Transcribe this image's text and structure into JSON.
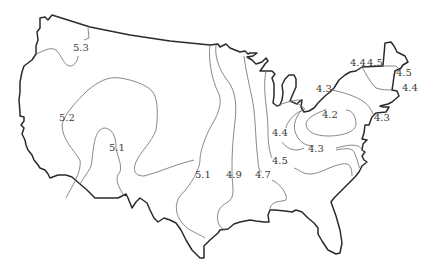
{
  "map": {
    "type": "isoline-map",
    "region": "Contiguous United States",
    "labels": [
      {
        "id": "l1",
        "text": "5.3",
        "x": 80,
        "y": 51
      },
      {
        "id": "l2",
        "text": "5.2",
        "x": 66,
        "y": 121
      },
      {
        "id": "l3",
        "text": "5.1",
        "x": 116,
        "y": 151
      },
      {
        "id": "l4",
        "text": "5.1",
        "x": 203,
        "y": 178
      },
      {
        "id": "l5",
        "text": "4.9",
        "x": 233,
        "y": 178
      },
      {
        "id": "l6",
        "text": "4.7",
        "x": 262,
        "y": 178
      },
      {
        "id": "l7",
        "text": "4.5",
        "x": 287,
        "y": 164
      },
      {
        "id": "l8",
        "text": "4.4",
        "x": 280,
        "y": 136
      },
      {
        "id": "l9",
        "text": "4.3",
        "x": 326,
        "y": 152
      },
      {
        "id": "l10",
        "text": "4.2",
        "x": 334,
        "y": 118
      },
      {
        "id": "l11",
        "text": "4.3",
        "x": 319,
        "y": 92
      },
      {
        "id": "l12",
        "text": "4.4",
        "x": 363,
        "y": 66
      },
      {
        "id": "l13",
        "text": "4.5",
        "x": 378,
        "y": 66
      },
      {
        "id": "l14",
        "text": "4.5",
        "x": 404,
        "y": 76
      },
      {
        "id": "l15",
        "text": "4.4",
        "x": 411,
        "y": 91
      },
      {
        "id": "l16",
        "text": "4.3",
        "x": 383,
        "y": 121
      }
    ],
    "colors": {
      "outline": "#2a2a2a",
      "contour": "#6a6a6a",
      "label": "#3a3a3a",
      "background": "#ffffff"
    }
  }
}
